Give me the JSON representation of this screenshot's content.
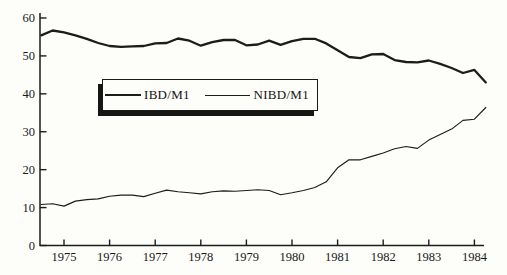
{
  "figure": {
    "background_color": "#fdfdfa",
    "ink_color": "#1c1c1c"
  },
  "chart_data": {
    "type": "line",
    "title": "",
    "xlabel": "",
    "ylabel": "",
    "grid": false,
    "xlim": [
      1974.35,
      1984.6
    ],
    "ylim": [
      0,
      60
    ],
    "x_ticks": [
      1975,
      1976,
      1977,
      1978,
      1979,
      1980,
      1981,
      1982,
      1983,
      1984
    ],
    "y_ticks": [
      0,
      10,
      20,
      30,
      40,
      50,
      60
    ],
    "x": [
      1974.5,
      1974.75,
      1975,
      1975.25,
      1975.5,
      1975.75,
      1976,
      1976.25,
      1976.5,
      1976.75,
      1977,
      1977.25,
      1977.5,
      1977.75,
      1978,
      1978.25,
      1978.5,
      1978.75,
      1979,
      1979.25,
      1979.5,
      1979.75,
      1980,
      1980.25,
      1980.5,
      1980.75,
      1981,
      1981.25,
      1981.5,
      1981.75,
      1982,
      1982.25,
      1982.5,
      1982.75,
      1983,
      1983.25,
      1983.5,
      1983.75,
      1984,
      1984.25
    ],
    "series": [
      {
        "name": "IBD/M1",
        "line_weight": "thick",
        "values": [
          55.4,
          56.7,
          56.2,
          55.4,
          54.5,
          53.4,
          52.6,
          52.4,
          52.5,
          52.6,
          53.3,
          53.4,
          54.6,
          54.0,
          52.7,
          53.6,
          54.2,
          54.2,
          52.8,
          53.0,
          54.0,
          52.9,
          53.9,
          54.5,
          54.5,
          53.3,
          51.5,
          49.7,
          49.4,
          50.4,
          50.5,
          48.9,
          48.4,
          48.3,
          48.8,
          47.9,
          46.8,
          45.5,
          46.3,
          43.0
        ]
      },
      {
        "name": "NIBD/M1",
        "line_weight": "thin",
        "values": [
          10.8,
          11.0,
          10.4,
          11.7,
          12.1,
          12.3,
          13.0,
          13.3,
          13.3,
          12.9,
          13.8,
          14.6,
          14.2,
          13.9,
          13.6,
          14.2,
          14.4,
          14.3,
          14.5,
          14.7,
          14.5,
          13.4,
          13.9,
          14.5,
          15.3,
          16.8,
          20.5,
          22.6,
          22.6,
          23.5,
          24.4,
          25.5,
          26.1,
          25.6,
          27.8,
          29.3,
          30.7,
          33.0,
          33.3,
          36.4
        ]
      }
    ],
    "legend_position": "inside upper-center boxed with drop shadow"
  }
}
